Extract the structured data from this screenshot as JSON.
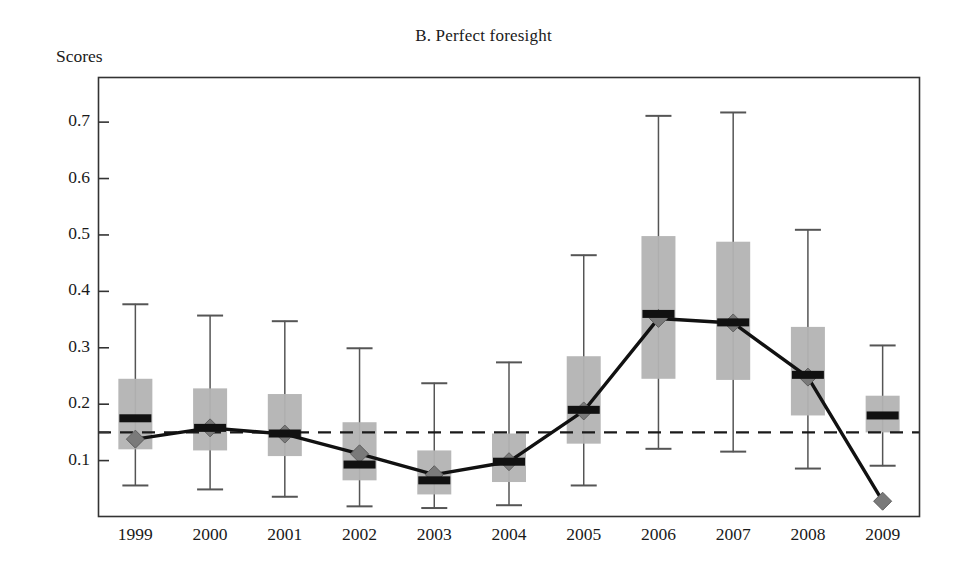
{
  "figure": {
    "title": "B. Perfect foresight",
    "y_axis_title": "Scores"
  },
  "chart_data": {
    "type": "bar",
    "subtype": "box-and-whisker with overlaid line series",
    "title": "B. Perfect foresight",
    "xlabel": "",
    "ylabel": "Scores",
    "categories": [
      "1999",
      "2000",
      "2001",
      "2002",
      "2003",
      "2004",
      "2005",
      "2006",
      "2007",
      "2008",
      "2009"
    ],
    "ylim": [
      0.0,
      0.78
    ],
    "yticks": [
      0.1,
      0.2,
      0.3,
      0.4,
      0.5,
      0.6,
      0.7
    ],
    "ytick_labels": [
      "0.1",
      "0.2",
      "0.3",
      "0.4",
      "0.5",
      "0.6",
      "0.7"
    ],
    "grid": false,
    "legend": "none",
    "reference_line": {
      "label": "reference",
      "value": 0.15,
      "style": "dashed",
      "color": "#1a1a1a"
    },
    "colors": {
      "box_fill": "#b3b3b3",
      "median_bar": "#111111",
      "whisker": "#555555",
      "line_series": "#111111",
      "marker": "#7a7a7a",
      "axis": "#333333"
    },
    "series": [
      {
        "name": "Perfect foresight score",
        "type": "line",
        "marker": "diamond",
        "values": [
          0.138,
          0.158,
          0.147,
          0.112,
          0.075,
          0.098,
          0.188,
          0.352,
          0.344,
          0.248,
          0.028
        ]
      }
    ],
    "boxplots": [
      {
        "category": "1999",
        "whisker_low": 0.055,
        "box_low": 0.12,
        "median": 0.175,
        "box_high": 0.245,
        "whisker_high": 0.378
      },
      {
        "category": "2000",
        "whisker_low": 0.048,
        "box_low": 0.118,
        "median": 0.158,
        "box_high": 0.228,
        "whisker_high": 0.358
      },
      {
        "category": "2001",
        "whisker_low": 0.035,
        "box_low": 0.108,
        "median": 0.148,
        "box_high": 0.218,
        "whisker_high": 0.348
      },
      {
        "category": "2002",
        "whisker_low": 0.018,
        "box_low": 0.065,
        "median": 0.093,
        "box_high": 0.168,
        "whisker_high": 0.3
      },
      {
        "category": "2003",
        "whisker_low": 0.015,
        "box_low": 0.04,
        "median": 0.065,
        "box_high": 0.118,
        "whisker_high": 0.238
      },
      {
        "category": "2004",
        "whisker_low": 0.02,
        "box_low": 0.062,
        "median": 0.098,
        "box_high": 0.148,
        "whisker_high": 0.275
      },
      {
        "category": "2005",
        "whisker_low": 0.055,
        "box_low": 0.13,
        "median": 0.19,
        "box_high": 0.285,
        "whisker_high": 0.465
      },
      {
        "category": "2006",
        "whisker_low": 0.12,
        "box_low": 0.245,
        "median": 0.36,
        "box_high": 0.498,
        "whisker_high": 0.712
      },
      {
        "category": "2007",
        "whisker_low": 0.115,
        "box_low": 0.243,
        "median": 0.345,
        "box_high": 0.488,
        "whisker_high": 0.718
      },
      {
        "category": "2008",
        "whisker_low": 0.085,
        "box_low": 0.18,
        "median": 0.252,
        "box_high": 0.337,
        "whisker_high": 0.51
      },
      {
        "category": "2009",
        "whisker_low": 0.09,
        "box_low": 0.15,
        "median": 0.18,
        "box_high": 0.215,
        "whisker_high": 0.305
      }
    ]
  }
}
